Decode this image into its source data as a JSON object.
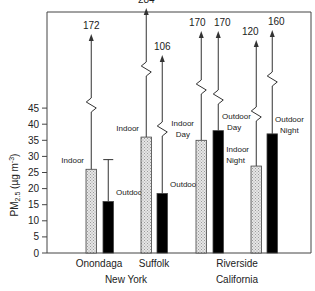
{
  "chart_data": {
    "type": "bar",
    "title": "",
    "ylabel": "PM2.5 (µg m-3)",
    "ylabel_main": "PM",
    "ylabel_sub": "2.5",
    "ylabel_unit": " (µg m",
    "ylabel_sup": "-3",
    "ylabel_close": ")",
    "ylim": [
      0,
      45
    ],
    "yticks": [
      0,
      5,
      10,
      15,
      20,
      25,
      30,
      35,
      40,
      45
    ],
    "grid": false,
    "legend": "none (inline labels)",
    "categories": [
      "Onondaga",
      "Suffolk",
      "Riverside"
    ],
    "groups": [
      {
        "name": "New York",
        "sites": [
          "Onondaga",
          "Suffolk"
        ]
      },
      {
        "name": "California",
        "sites": [
          "Riverside"
        ]
      }
    ],
    "bars": [
      {
        "site": "Onondaga",
        "label": "Indoor",
        "label2": "",
        "type": "indoor",
        "value": 26,
        "max": 172,
        "error_upper": null
      },
      {
        "site": "Onondaga",
        "label": "Outdoor",
        "label2": "",
        "type": "outdoor",
        "value": 16,
        "max": null,
        "error_upper": 29
      },
      {
        "site": "Suffolk",
        "label": "Indoor",
        "label2": "",
        "type": "indoor",
        "value": 36,
        "max": 284,
        "error_upper": null
      },
      {
        "site": "Suffolk",
        "label": "Outdoor",
        "label2": "",
        "type": "outdoor",
        "value": 18.5,
        "max": 106,
        "error_upper": null
      },
      {
        "site": "Riverside",
        "label": "Indoor",
        "label2": "Day",
        "type": "indoor",
        "value": 35,
        "max": 170,
        "error_upper": null
      },
      {
        "site": "Riverside",
        "label": "Outdoor",
        "label2": "Day",
        "type": "outdoor",
        "value": 38,
        "max": 170,
        "error_upper": null
      },
      {
        "site": "Riverside",
        "label": "Indoor",
        "label2": "Night",
        "type": "indoor",
        "value": 27,
        "max": 120,
        "error_upper": null
      },
      {
        "site": "Riverside",
        "label": "Outdoor",
        "label2": "Night",
        "type": "outdoor",
        "value": 37,
        "max": 160,
        "error_upper": null
      }
    ],
    "colors": {
      "indoor_fill": "#d4d4d4",
      "outdoor_fill": "#000000",
      "axis": "#333333"
    }
  }
}
